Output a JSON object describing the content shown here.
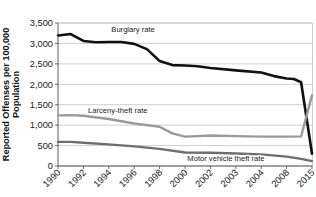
{
  "chart_data": {
    "type": "line",
    "title": "",
    "xlabel": "",
    "ylabel": "Reported Offenses per 100,000 Population",
    "ylabel_line1": "Reported Offenses per 100,000",
    "ylabel_line2": "Population",
    "ylim": [
      0,
      3500
    ],
    "ystep": 500,
    "grid": true,
    "legend_position": "inline-labels",
    "categories": [
      "1990",
      "1992",
      "1994",
      "1996",
      "1998",
      "2000",
      "2002",
      "2003",
      "2004",
      "2008",
      "2015"
    ],
    "ytick_labels": [
      "0",
      "500",
      "1,000",
      "1,500",
      "2,000",
      "2,500",
      "3,000",
      "3,500"
    ],
    "ytick_values": [
      0,
      500,
      1000,
      1500,
      2000,
      2500,
      3000,
      3500
    ],
    "series": [
      {
        "name": "Burglary rate",
        "color": "#111111",
        "width": 2.6,
        "label_x_frac": 0.295,
        "label_y_value": 3280,
        "values": [
          3195,
          3230,
          3060,
          3035,
          3035,
          2460,
          2340,
          2300,
          2250,
          2140,
          300
        ],
        "points": [
          {
            "x": "1990",
            "y": 3195
          },
          {
            "x": "1991",
            "y": 3230
          },
          {
            "x": "1992",
            "y": 3060
          },
          {
            "x": "1993",
            "y": 3030
          },
          {
            "x": "1994",
            "y": 3035
          },
          {
            "x": "1995",
            "y": 3035
          },
          {
            "x": "1996",
            "y": 2990
          },
          {
            "x": "1997",
            "y": 2860
          },
          {
            "x": "1998",
            "y": 2570
          },
          {
            "x": "1999",
            "y": 2470
          },
          {
            "x": "2000",
            "y": 2460
          },
          {
            "x": "2001",
            "y": 2440
          },
          {
            "x": "2002",
            "y": 2400
          },
          {
            "x": "2003",
            "y": 2340
          },
          {
            "x": "2004",
            "y": 2290
          },
          {
            "x": "2006",
            "y": 2200
          },
          {
            "x": "2008",
            "y": 2140
          },
          {
            "x": "2010",
            "y": 2130
          },
          {
            "x": "2012",
            "y": 2050
          },
          {
            "x": "2015",
            "y": 300
          }
        ]
      },
      {
        "name": "Larceny-theft rate",
        "color": "#9a9a9a",
        "width": 2.4,
        "label_x_frac": 0.235,
        "label_y_value": 1290,
        "values": [
          1240,
          1230,
          1150,
          1040,
          960,
          720,
          740,
          730,
          720,
          720,
          1730
        ],
        "points": [
          {
            "x": "1990",
            "y": 1240
          },
          {
            "x": "1991",
            "y": 1245
          },
          {
            "x": "1992",
            "y": 1230
          },
          {
            "x": "1994",
            "y": 1150
          },
          {
            "x": "1996",
            "y": 1040
          },
          {
            "x": "1998",
            "y": 960
          },
          {
            "x": "1999",
            "y": 800
          },
          {
            "x": "2000",
            "y": 720
          },
          {
            "x": "2001",
            "y": 730
          },
          {
            "x": "2002",
            "y": 745
          },
          {
            "x": "2003",
            "y": 730
          },
          {
            "x": "2004",
            "y": 720
          },
          {
            "x": "2008",
            "y": 720
          },
          {
            "x": "2012",
            "y": 725
          },
          {
            "x": "2015",
            "y": 1730
          }
        ]
      },
      {
        "name": "Motor vehicle theft rate",
        "color": "#6e6e6e",
        "width": 2.4,
        "label_x_frac": 0.66,
        "label_y_value": 130,
        "values": [
          590,
          585,
          560,
          520,
          460,
          330,
          320,
          300,
          280,
          230,
          120
        ],
        "points": [
          {
            "x": "1990",
            "y": 590
          },
          {
            "x": "1991",
            "y": 590
          },
          {
            "x": "1992",
            "y": 570
          },
          {
            "x": "1994",
            "y": 530
          },
          {
            "x": "1996",
            "y": 480
          },
          {
            "x": "1998",
            "y": 420
          },
          {
            "x": "2000",
            "y": 330
          },
          {
            "x": "2002",
            "y": 325
          },
          {
            "x": "2003",
            "y": 305
          },
          {
            "x": "2004",
            "y": 285
          },
          {
            "x": "2008",
            "y": 230
          },
          {
            "x": "2012",
            "y": 175
          },
          {
            "x": "2015",
            "y": 120
          }
        ]
      }
    ]
  }
}
